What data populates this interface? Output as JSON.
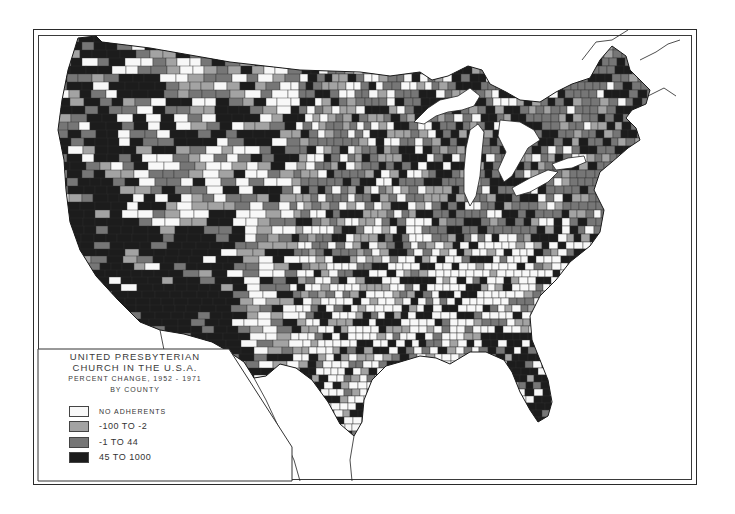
{
  "legend": {
    "title_line1": "UNITED PRESBYTERIAN",
    "title_line2": "CHURCH IN THE U.S.A.",
    "subtitle": "PERCENT CHANGE, 1952 - 1971",
    "subtitle2": "BY COUNTY",
    "items": [
      {
        "label": "NO ADHERENTS",
        "color": "#f8f8f8"
      },
      {
        "label": "-100 TO -2",
        "color": "#a3a3a3"
      },
      {
        "label": "-1 TO 44",
        "color": "#767676"
      },
      {
        "label": "45 TO 1000",
        "color": "#1c1c1c"
      }
    ]
  },
  "map": {
    "subject": "Contiguous United States counties",
    "classes": [
      "no_adherents",
      "-100_to_-2",
      "-1_to_44",
      "45_to_1000"
    ],
    "regions": [
      {
        "name": "Pacific Northwest",
        "dominant": "45_to_1000"
      },
      {
        "name": "California / Southwest",
        "dominant": "45_to_1000"
      },
      {
        "name": "Mountain West",
        "dominant": "mixed"
      },
      {
        "name": "Great Plains",
        "dominant": "mixed"
      },
      {
        "name": "Midwest / Great Lakes",
        "dominant": "-1_to_44"
      },
      {
        "name": "Northeast",
        "dominant": "-1_to_44"
      },
      {
        "name": "Southeast / Gulf Coast",
        "dominant": "no_adherents"
      },
      {
        "name": "Florida",
        "dominant": "45_to_1000"
      },
      {
        "name": "Texas",
        "dominant": "mixed"
      }
    ]
  }
}
